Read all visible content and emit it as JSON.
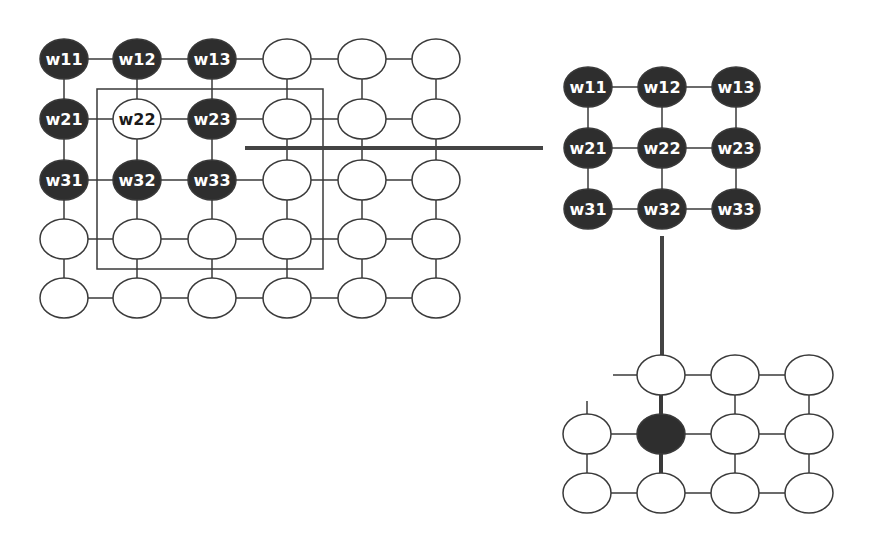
{
  "colors": {
    "dark_node": "#2e2e2e",
    "light_node": "#ffffff",
    "stroke": "#3a3a3a",
    "label_on_dark": "#ffffff",
    "label_on_light": "#1a1a1a",
    "connector": "#444444"
  },
  "left_grid": {
    "cols": [
      64,
      137,
      212,
      287,
      362,
      436
    ],
    "rows": [
      59,
      119,
      180,
      239,
      298
    ],
    "rx": 24,
    "ry": 20,
    "labels": {
      "0_0": "w11",
      "0_1": "w12",
      "0_2": "w13",
      "1_0": "w21",
      "1_1": "w22",
      "1_2": "w23",
      "2_0": "w31",
      "2_1": "w32",
      "2_2": "w33"
    },
    "dark": [
      "0_0",
      "0_1",
      "0_2",
      "1_0",
      "1_2",
      "2_0",
      "2_1",
      "2_2"
    ],
    "window_box": {
      "x": 97,
      "y": 89,
      "w": 226,
      "h": 180
    }
  },
  "connector_horizontal": {
    "x1": 245,
    "y1": 148,
    "x2": 543,
    "y2": 148
  },
  "kernel": {
    "cols": [
      588,
      662,
      736
    ],
    "rows": [
      87,
      148,
      209
    ],
    "rx": 24,
    "ry": 20,
    "labels": [
      [
        "w11",
        "w12",
        "w13"
      ],
      [
        "w21",
        "w22",
        "w23"
      ],
      [
        "w31",
        "w32",
        "w33"
      ]
    ]
  },
  "connector_vertical": {
    "x1": 662,
    "y1": 236,
    "x2": 662,
    "y2": 356
  },
  "output_grid": {
    "cols": [
      587,
      661,
      735,
      809
    ],
    "rows": [
      375,
      434,
      493
    ],
    "rx": 24,
    "ry": 20,
    "row0_start_col": 1,
    "highlighted": "1_1"
  }
}
